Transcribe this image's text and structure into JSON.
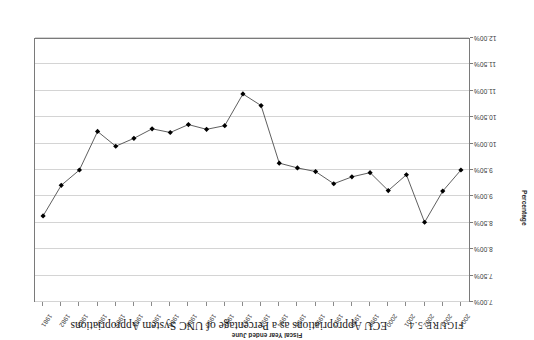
{
  "figure": {
    "number": "FIGURE 5.4",
    "title": "ECU Appropriations as a Percentage of UNC System Appropriations",
    "orientation_note": "page-rotated-180"
  },
  "axis": {
    "y_title": "Percentage",
    "x_title": "Fiscal Year ended June",
    "y_ticks": [
      "7.00%",
      "7.50%",
      "8.00%",
      "8.50%",
      "9.00%",
      "9.50%",
      "10.00%",
      "10.50%",
      "11.00%",
      "11.50%",
      "12.00%"
    ]
  },
  "colors": {
    "line": "#4d4d4d",
    "marker": "#000000",
    "grid": "#d4d4d4",
    "frame": "#7a7a7a",
    "text": "#3a3a3a"
  },
  "chart_data": {
    "type": "line",
    "title": "ECU Appropriations as a Percentage of UNC System Appropriations",
    "xlabel": "Fiscal Year ended June",
    "ylabel": "Percentage",
    "ylim": [
      7.0,
      12.0
    ],
    "y_inverted": true,
    "grid": true,
    "legend": "none",
    "marker": "diamond",
    "categories": [
      "1981",
      "1982",
      "1983",
      "1984",
      "1985",
      "1986",
      "1987",
      "1988",
      "1989",
      "1990",
      "1991",
      "1992",
      "1993",
      "1994",
      "1995",
      "1996",
      "1997",
      "1998",
      "1999",
      "2000",
      "2001",
      "2002",
      "2003",
      "2004"
    ],
    "values": [
      8.63,
      9.21,
      9.5,
      10.23,
      9.95,
      10.1,
      10.28,
      10.21,
      10.36,
      10.27,
      10.34,
      10.94,
      10.72,
      9.63,
      9.54,
      9.47,
      9.24,
      9.37,
      9.45,
      9.11,
      9.41,
      8.51,
      9.1,
      9.5
    ],
    "series": [
      {
        "name": "ECU Appropriations as a Percentage of UNC System Appropriations",
        "points": [
          {
            "x": "1981",
            "y": 8.63
          },
          {
            "x": "1982",
            "y": 9.21
          },
          {
            "x": "1983",
            "y": 9.5
          },
          {
            "x": "1984",
            "y": 10.23
          },
          {
            "x": "1985",
            "y": 9.95
          },
          {
            "x": "1986",
            "y": 10.1
          },
          {
            "x": "1987",
            "y": 10.28
          },
          {
            "x": "1988",
            "y": 10.21
          },
          {
            "x": "1989",
            "y": 10.36
          },
          {
            "x": "1990",
            "y": 10.27
          },
          {
            "x": "1991",
            "y": 10.34
          },
          {
            "x": "1992",
            "y": 10.94
          },
          {
            "x": "1993",
            "y": 10.72
          },
          {
            "x": "1994",
            "y": 9.63
          },
          {
            "x": "1995",
            "y": 9.54
          },
          {
            "x": "1996",
            "y": 9.47
          },
          {
            "x": "1997",
            "y": 9.24
          },
          {
            "x": "1998",
            "y": 9.37
          },
          {
            "x": "1999",
            "y": 9.45
          },
          {
            "x": "2000",
            "y": 9.11
          },
          {
            "x": "2001",
            "y": 9.41
          },
          {
            "x": "2002",
            "y": 8.51
          },
          {
            "x": "2003",
            "y": 9.1
          },
          {
            "x": "2004",
            "y": 9.5
          }
        ]
      }
    ]
  }
}
